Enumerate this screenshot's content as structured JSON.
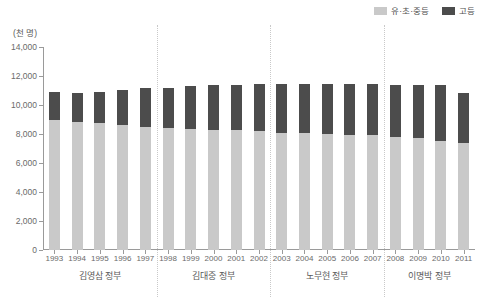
{
  "chart_data": {
    "type": "bar",
    "title": "",
    "subtitle": "",
    "stacked": true,
    "unit_label": "(천 명)",
    "xlabel": "",
    "ylabel": "",
    "ylim": [
      0,
      14000
    ],
    "ytick_values": [
      0,
      2000,
      4000,
      6000,
      8000,
      10000,
      12000,
      14000
    ],
    "ytick_labels": [
      "0",
      "2,000",
      "4,000",
      "6,000",
      "8,000",
      "10,000",
      "12,000",
      "14,000"
    ],
    "grid": false,
    "legend_position": "top-right",
    "categories": [
      "1993",
      "1994",
      "1995",
      "1996",
      "1997",
      "1998",
      "1999",
      "2000",
      "2001",
      "2002",
      "2003",
      "2004",
      "2005",
      "2006",
      "2007",
      "2008",
      "2009",
      "2010",
      "2011"
    ],
    "series": [
      {
        "name": "유·초·중등",
        "color": "#c9c9c9",
        "values": [
          9000,
          8800,
          8750,
          8600,
          8500,
          8400,
          8350,
          8300,
          8250,
          8200,
          8100,
          8050,
          8000,
          7950,
          7900,
          7800,
          7700,
          7500,
          7350
        ]
      },
      {
        "name": "고등",
        "color": "#4c4c4c",
        "values": [
          1900,
          2050,
          2150,
          2450,
          2700,
          2800,
          2950,
          3050,
          3150,
          3250,
          3350,
          3400,
          3450,
          3500,
          3550,
          3600,
          3650,
          3850,
          3450
        ]
      }
    ],
    "totals": [
      10900,
      10850,
      10900,
      11050,
      11200,
      11200,
      11300,
      11350,
      11400,
      11450,
      11450,
      11450,
      11450,
      11450,
      11450,
      11400,
      11350,
      11350,
      10800
    ],
    "annotations": []
  },
  "legend": {
    "items": [
      {
        "label": "유·초·중등",
        "color": "#c9c9c9"
      },
      {
        "label": "고등",
        "color": "#4c4c4c"
      }
    ]
  },
  "periods": [
    {
      "label": "김영삼 정부",
      "start": "1993",
      "end": "1997"
    },
    {
      "label": "김대중 정부",
      "start": "1998",
      "end": "2002"
    },
    {
      "label": "노무현 정부",
      "start": "2003",
      "end": "2007"
    },
    {
      "label": "이명박 정부",
      "start": "2008",
      "end": "2011"
    }
  ],
  "dividers": [
    "1997|1998",
    "2002|2003",
    "2007|2008"
  ]
}
